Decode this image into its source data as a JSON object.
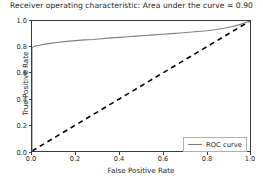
{
  "chart_data": {
    "type": "line",
    "title": "Receiver operating characteristic: Area under the curve = 0.90",
    "xlabel": "False Positive Rate",
    "ylabel": "True Positive Rate",
    "xlim": [
      0.0,
      1.0
    ],
    "ylim": [
      0.0,
      1.0
    ],
    "grid": false,
    "legend_position": "lower right",
    "auc": 0.9,
    "xticks": [
      "0.0",
      "0.2",
      "0.4",
      "0.6",
      "0.8",
      "1.0"
    ],
    "xtick_values": [
      0.0,
      0.2,
      0.4,
      0.6,
      0.8,
      1.0
    ],
    "yticks": [
      "0.0",
      "0.2",
      "0.4",
      "0.6",
      "0.8",
      "1.0"
    ],
    "ytick_values": [
      0.0,
      0.2,
      0.4,
      0.6,
      0.8,
      1.0
    ],
    "series": [
      {
        "name": "ROC curve",
        "style": "solid",
        "color": "#7f7f7f",
        "x": [
          0.0,
          0.0,
          0.01,
          0.03,
          0.06,
          0.09,
          0.12,
          0.16,
          0.2,
          0.24,
          0.28,
          0.32,
          0.36,
          0.4,
          0.44,
          0.48,
          0.52,
          0.56,
          0.6,
          0.64,
          0.68,
          0.72,
          0.76,
          0.8,
          0.84,
          0.88,
          0.92,
          0.96,
          1.0
        ],
        "y": [
          0.0,
          0.795,
          0.805,
          0.812,
          0.822,
          0.83,
          0.836,
          0.843,
          0.849,
          0.855,
          0.858,
          0.864,
          0.87,
          0.874,
          0.879,
          0.884,
          0.889,
          0.893,
          0.898,
          0.903,
          0.908,
          0.913,
          0.919,
          0.925,
          0.933,
          0.944,
          0.958,
          0.976,
          1.0
        ]
      },
      {
        "name": "chance-diagonal",
        "style": "dashed",
        "color": "#000000",
        "x": [
          0.0,
          1.0
        ],
        "y": [
          0.0,
          1.0
        ]
      }
    ]
  },
  "legend": {
    "entries": [
      {
        "label": "ROC curve"
      }
    ]
  }
}
